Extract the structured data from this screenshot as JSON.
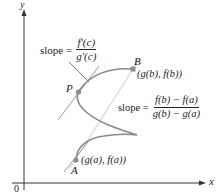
{
  "figure": {
    "axes": {
      "x_label": "x",
      "y_label": "y",
      "origin_label": "0"
    },
    "points": {
      "P": {
        "label": "P"
      },
      "A": {
        "label": "A",
        "coord_label": "(g(a), f(a))"
      },
      "B": {
        "label": "B",
        "coord_label": "(g(b), f(b))"
      }
    },
    "tangent_annotation": {
      "prefix": "slope =",
      "numerator": "f′(c)",
      "denominator": "g′(c)"
    },
    "secant_annotation": {
      "prefix": "slope =",
      "numerator": "f(b) − f(a)",
      "denominator": "g(b) − g(a)"
    },
    "colors": {
      "curve": "#8a8a8a",
      "tangent": "#9a9a9a",
      "secant": "#d0d0d0",
      "axis": "#333333",
      "point": "#8c8c8c",
      "text": "#222222"
    }
  }
}
